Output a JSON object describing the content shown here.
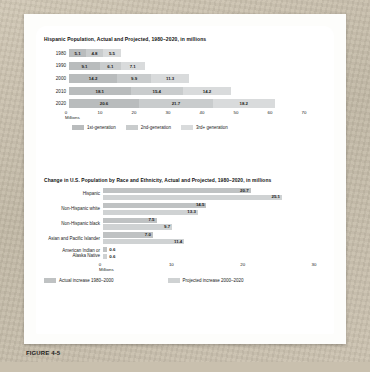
{
  "figure": {
    "caption": "FIGURE 4-5"
  },
  "colors": {
    "series1": "#b9bcbd",
    "series2": "#c9cccd",
    "series3": "#d9dbdc",
    "actual": "#bfc2c3",
    "projected": "#cfd2d3",
    "text": "#1a1a1a"
  },
  "chart_data": [
    {
      "type": "bar",
      "orientation": "horizontal",
      "stacked": true,
      "title": "Hispanic Population, Actual and Projected, 1980–2020, in millions",
      "xlabel": "Millions",
      "ylabel": "",
      "xlim": [
        0,
        70
      ],
      "xticks": [
        "0",
        "10",
        "20",
        "30",
        "40",
        "50",
        "60",
        "70"
      ],
      "categories": [
        "1980",
        "1990",
        "2000",
        "2010",
        "2020"
      ],
      "grid": false,
      "legend_position": "bottom",
      "series": [
        {
          "name": "1st-generation",
          "values": [
            5.1,
            9.1,
            14.2,
            18.1,
            20.6
          ]
        },
        {
          "name": "2nd-generation",
          "values": [
            4.8,
            6.1,
            9.9,
            15.4,
            21.7
          ]
        },
        {
          "name": "3rd+ generation",
          "values": [
            5.5,
            7.1,
            11.3,
            14.2,
            18.2
          ]
        }
      ],
      "legend": [
        "1st-generation",
        "2nd-generation",
        "3rd+ generation"
      ]
    },
    {
      "type": "bar",
      "orientation": "horizontal",
      "stacked": false,
      "title": "Change in U.S. Population by Race and Ethnicity, Actual and Projected, 1980–2020, in millions",
      "xlabel": "Millions",
      "ylabel": "",
      "xlim": [
        0,
        30
      ],
      "xticks": [
        "0",
        "10",
        "20",
        "30"
      ],
      "categories": [
        "Hispanic",
        "Non-Hispanic white",
        "Non-Hispanic black",
        "Asian and Pacific Islander",
        "American Indian or\nAlaska Native"
      ],
      "grid": false,
      "legend_position": "bottom",
      "series": [
        {
          "name": "Actual increase 1980–2000",
          "values": [
            20.7,
            14.5,
            7.5,
            7.0,
            0.6
          ]
        },
        {
          "name": "Projected increase 2000–2020",
          "values": [
            25.1,
            13.3,
            9.7,
            11.4,
            0.6
          ]
        }
      ],
      "legend": [
        "Actual increase 1980–2000",
        "Projected increase 2000–2020"
      ]
    }
  ]
}
